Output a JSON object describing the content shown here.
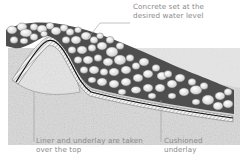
{
  "diagram": {
    "type": "cross-section illustration",
    "labels": {
      "concrete": {
        "line1": "Concrete set at the",
        "line2": "desired water level"
      },
      "liner": {
        "line1": "Liner and underlay are taken",
        "line2": "over the top"
      },
      "underlay": {
        "line1": "Cushioned",
        "line2": "underlay"
      }
    },
    "colors": {
      "soil": "#d6d6d6",
      "stone": "#e8e8e8",
      "stone_outline": "#6f6f6f",
      "pebble_bed": "#555555",
      "liner": "#1a1a1a",
      "label_text": "#8a8a8a",
      "leader_line": "#9a9a9a"
    }
  }
}
